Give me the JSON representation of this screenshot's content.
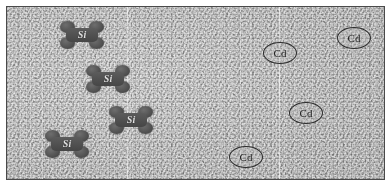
{
  "figure": {
    "kind": "scanning-probe-micrograph",
    "frame_color": "#4a4a4a",
    "background_color": "#bcbcbc",
    "annotation_color": "#2c2c2c"
  },
  "scanlines": [
    {
      "name": "scan-line-1",
      "x": 120
    },
    {
      "name": "scan-line-2",
      "x": 272
    }
  ],
  "si_clusters": [
    {
      "label": "Si",
      "x": 52,
      "y": 14
    },
    {
      "label": "Si",
      "x": 78,
      "y": 58
    },
    {
      "label": "Si",
      "x": 101,
      "y": 99
    },
    {
      "label": "Si",
      "x": 37,
      "y": 123
    }
  ],
  "cd_markers": [
    {
      "label": "Cd",
      "x": 330,
      "y": 20
    },
    {
      "label": "Cd",
      "x": 256,
      "y": 35
    },
    {
      "label": "Cd",
      "x": 282,
      "y": 95
    },
    {
      "label": "Cd",
      "x": 222,
      "y": 139
    }
  ]
}
